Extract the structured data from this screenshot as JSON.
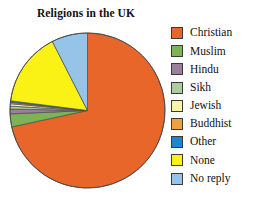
{
  "chart_data": {
    "type": "pie",
    "title": "Religions in the UK",
    "xlabel": "",
    "ylabel": "",
    "legend_position": "right",
    "grid": false,
    "start_angle_deg": 0,
    "direction": "clockwise",
    "categories": [
      "Christian",
      "Muslim",
      "Hindu",
      "Sikh",
      "Jewish",
      "Buddhist",
      "Other",
      "None",
      "No reply"
    ],
    "values": [
      71.6,
      2.7,
      1.0,
      0.6,
      0.5,
      0.3,
      0.3,
      15.5,
      7.5
    ],
    "colors": [
      "#E8662A",
      "#7DB357",
      "#9B7E9B",
      "#AECCA1",
      "#FAF3A8",
      "#F0A03C",
      "#1C86D0",
      "#FAF215",
      "#96C3E8"
    ],
    "slices": [
      {
        "label": "Christian",
        "value": 71.6,
        "color": "#E8662A"
      },
      {
        "label": "Muslim",
        "value": 2.7,
        "color": "#7DB357"
      },
      {
        "label": "Hindu",
        "value": 1.0,
        "color": "#9B7E9B"
      },
      {
        "label": "Sikh",
        "value": 0.6,
        "color": "#AECCA1"
      },
      {
        "label": "Jewish",
        "value": 0.5,
        "color": "#FAF3A8"
      },
      {
        "label": "Buddhist",
        "value": 0.3,
        "color": "#F0A03C"
      },
      {
        "label": "Other",
        "value": 0.3,
        "color": "#1C86D0"
      },
      {
        "label": "None",
        "value": 15.5,
        "color": "#FAF215"
      },
      {
        "label": "No reply",
        "value": 7.5,
        "color": "#96C3E8"
      }
    ]
  },
  "legend": {
    "items": [
      {
        "label": "Christian",
        "color": "#E8662A"
      },
      {
        "label": "Muslim",
        "color": "#7DB357"
      },
      {
        "label": "Hindu",
        "color": "#9B7E9B"
      },
      {
        "label": "Sikh",
        "color": "#AECCA1"
      },
      {
        "label": "Jewish",
        "color": "#FAF3A8"
      },
      {
        "label": "Buddhist",
        "color": "#F0A03C"
      },
      {
        "label": "Other",
        "color": "#1C86D0"
      },
      {
        "label": "None",
        "color": "#FAF215"
      },
      {
        "label": "No reply",
        "color": "#96C3E8"
      }
    ]
  }
}
